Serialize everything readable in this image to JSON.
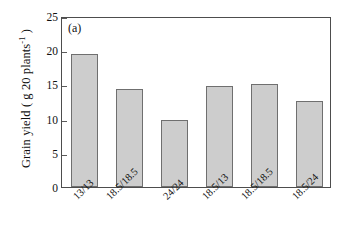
{
  "figure": {
    "panel_tag": "(a)",
    "background_color": "#ffffff",
    "frame_color": "#4d4d4d"
  },
  "chart_data": {
    "type": "bar",
    "title": "",
    "subtitle": "",
    "panel_label": "(a)",
    "categories": [
      "13/13",
      "18.5/18.5",
      "24/24",
      "18.5/13",
      "18.5/18.5",
      "18.5/24"
    ],
    "values": [
      19.4,
      14.3,
      9.8,
      14.8,
      15.0,
      12.6
    ],
    "xlabel": "",
    "ylabel": "Grain yield ( g 20 plants-1 )",
    "ylabel_prefix": "Grain yield ( g 20 plants",
    "ylabel_exponent": "-1",
    "ylabel_suffix": " )",
    "ylim": [
      0,
      25
    ],
    "yticks": [
      0,
      5,
      10,
      15,
      20,
      25
    ],
    "ytick_labels": [
      "0",
      "5",
      "10",
      "15",
      "20",
      "25"
    ],
    "grid": false,
    "legend": null,
    "bar_fill_color": "#cdcdcd",
    "bar_edge_color": "#6f6f6f",
    "xtick_label_rotation": -45
  }
}
